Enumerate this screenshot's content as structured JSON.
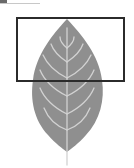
{
  "canvas": {
    "width": 134,
    "height": 168,
    "background": "#ffffff"
  },
  "leaf": {
    "fill": "#8f8f8f",
    "vein_color": "#d2d2d2",
    "icon": "leaf-icon"
  },
  "selection_rect": {
    "x": 16,
    "y": 17,
    "width": 109,
    "height": 65,
    "stroke": "#2b2b2b"
  }
}
